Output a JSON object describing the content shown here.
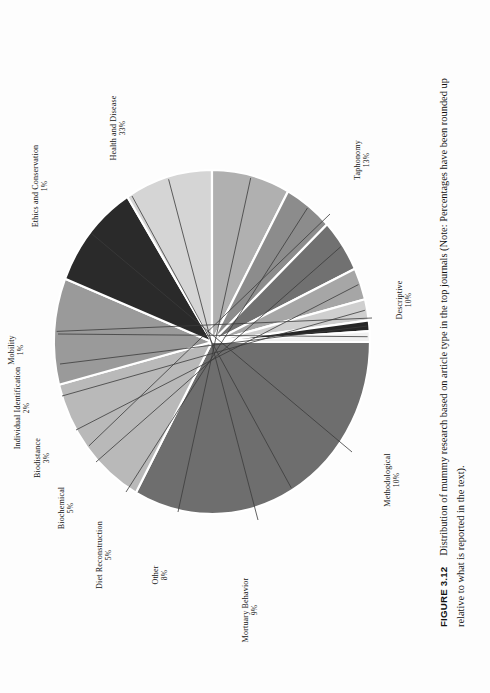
{
  "figure": {
    "number_label": "FIGURE 3.12",
    "caption": "Distribution of mummy research based on article type in the top journals (Note: Percentages have been rounded up relative to what is reported in the text)."
  },
  "chart_data": {
    "type": "pie",
    "title": "Distribution of mummy research based on article type in the top journals",
    "units": "percent",
    "total": 100,
    "start_angle_deg": -90,
    "direction": "clockwise",
    "categories": [
      "Health and Disease",
      "Taphonomy",
      "Descriptive",
      "Methodological",
      "Mortuary Behavior",
      "Other",
      "Diet Reconstruction",
      "Biochemical",
      "Biodistance",
      "Individual Identification",
      "Mobility",
      "Ethics and Conservation"
    ],
    "values": [
      33,
      13,
      10,
      10,
      9,
      8,
      5,
      5,
      3,
      2,
      1,
      1
    ],
    "colors": [
      "#6e6e6e",
      "#b9b9b9",
      "#9a9a9a",
      "#2a2a2a",
      "#d5d5d5",
      "#b0b0b0",
      "#8c8c8c",
      "#717171",
      "#a6a6a6",
      "#cfcfcf",
      "#262626",
      "#f0f0f0"
    ],
    "slices": [
      {
        "label": "Health and Disease",
        "value": 33,
        "display": "33%",
        "color": "#6e6e6e"
      },
      {
        "label": "Taphonomy",
        "value": 13,
        "display": "13%",
        "color": "#b9b9b9"
      },
      {
        "label": "Descriptive",
        "value": 10,
        "display": "10%",
        "color": "#9a9a9a"
      },
      {
        "label": "Methodological",
        "value": 10,
        "display": "10%",
        "color": "#2a2a2a"
      },
      {
        "label": "Mortuary Behavior",
        "value": 9,
        "display": "9%",
        "color": "#d5d5d5"
      },
      {
        "label": "Other",
        "value": 8,
        "display": "8%",
        "color": "#b0b0b0"
      },
      {
        "label": "Diet Reconstruction",
        "value": 5,
        "display": "5%",
        "color": "#8c8c8c"
      },
      {
        "label": "Biochemical",
        "value": 5,
        "display": "5%",
        "color": "#717171"
      },
      {
        "label": "Biodistance",
        "value": 3,
        "display": "3%",
        "color": "#a6a6a6"
      },
      {
        "label": "Individual Identification",
        "value": 2,
        "display": "2%",
        "color": "#cfcfcf"
      },
      {
        "label": "Mobility",
        "value": 1,
        "display": "1%",
        "color": "#262626"
      },
      {
        "label": "Ethics and Conservation",
        "value": 1,
        "display": "1%",
        "color": "#f0f0f0"
      }
    ],
    "legend": "none",
    "grid": false,
    "labels_position": "outside-with-leader-lines"
  },
  "geometry": {
    "cx": 212,
    "cy": 342,
    "rx": 158,
    "ry": 172,
    "separator_color": "#ffffff",
    "separator_width": 2.2,
    "outline_color": "#8a8a8a"
  }
}
